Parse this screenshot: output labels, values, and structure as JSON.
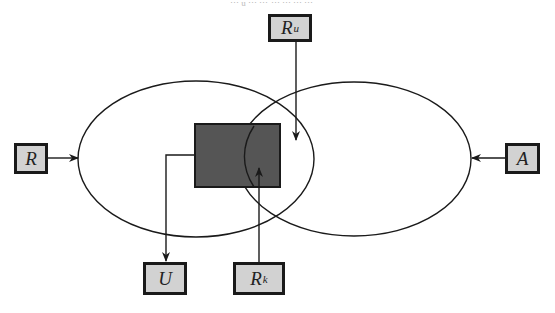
{
  "diagram": {
    "type": "set-overlap-flow",
    "header_fragment": "⋯ u ⋯ ⋯ ⋯ ⋯ ⋯ ⋯",
    "ellipses": [
      {
        "id": "left-set",
        "cx": 196,
        "cy": 159,
        "rx": 118,
        "ry": 78
      },
      {
        "id": "right-set",
        "cx": 354,
        "cy": 159,
        "rx": 117,
        "ry": 77
      }
    ],
    "core_region": {
      "x": 194,
      "y": 123,
      "width": 87,
      "height": 65,
      "color": "#555555"
    },
    "nodes": {
      "ru": {
        "base": "R",
        "sub": "u",
        "x": 268,
        "y": 14,
        "width": 44,
        "height": 28
      },
      "r": {
        "base": "R",
        "sub": "",
        "x": 14,
        "y": 143,
        "width": 34,
        "height": 31
      },
      "a": {
        "base": "A",
        "sub": "",
        "x": 505,
        "y": 143,
        "width": 35,
        "height": 31
      },
      "u": {
        "base": "U",
        "sub": "",
        "x": 143,
        "y": 262,
        "width": 44,
        "height": 33
      },
      "rk": {
        "base": "R",
        "sub": "k",
        "x": 233,
        "y": 262,
        "width": 52,
        "height": 33
      }
    },
    "edges": [
      {
        "from": "ru",
        "to": "overlap-region",
        "direction": "down"
      },
      {
        "from": "r",
        "to": "left-set",
        "direction": "right"
      },
      {
        "from": "a",
        "to": "right-set",
        "direction": "left"
      },
      {
        "from": "core_region",
        "to": "u",
        "direction": "down"
      },
      {
        "from": "rk",
        "to": "core_region",
        "direction": "up"
      }
    ],
    "colors": {
      "stroke": "#1a1a1a",
      "node_fill": "#d2d2d2",
      "core_fill": "#555555",
      "background": "#ffffff"
    }
  }
}
